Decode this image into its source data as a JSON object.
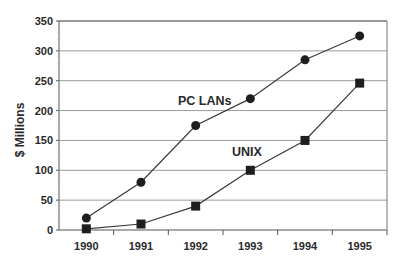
{
  "chart_data": {
    "type": "line",
    "title": "",
    "xlabel": "",
    "ylabel": "$ Millions",
    "categories": [
      "1990",
      "1991",
      "1992",
      "1993",
      "1994",
      "1995"
    ],
    "series": [
      {
        "name": "PC LANs",
        "marker": "circle",
        "values": [
          20,
          80,
          175,
          220,
          285,
          325
        ]
      },
      {
        "name": "UNIX",
        "marker": "square",
        "values": [
          2,
          10,
          40,
          100,
          150,
          246
        ]
      }
    ],
    "ylim": [
      0,
      350
    ],
    "yticks": [
      0,
      50,
      100,
      150,
      200,
      250,
      300,
      350
    ],
    "grid": true,
    "legend": "inline labels",
    "annotations": [
      {
        "text": "PC LANs",
        "near": "1992-1993 above line"
      },
      {
        "text": "UNIX",
        "near": "1993 above line"
      }
    ]
  },
  "colors": {
    "line": "#3a3a3a",
    "marker": "#1e1e1e",
    "grid": "#9a9a9a",
    "axis": "#555555",
    "text": "#2a2a2a"
  }
}
